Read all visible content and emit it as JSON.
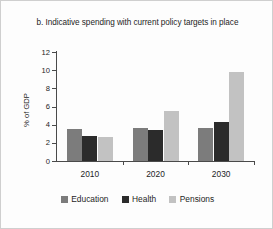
{
  "chart_data": {
    "type": "bar",
    "title": "b. Indicative spending with current policy targets in place",
    "xlabel": "",
    "ylabel": "% of GDP",
    "categories": [
      "2010",
      "2020",
      "2030"
    ],
    "series": [
      {
        "name": "Education",
        "color": "#7c7c7c",
        "values": [
          3.5,
          3.6,
          3.65
        ]
      },
      {
        "name": "Health",
        "color": "#2b2b2b",
        "values": [
          2.7,
          3.4,
          4.25
        ]
      },
      {
        "name": "Pensions",
        "color": "#c2c2c2",
        "values": [
          2.65,
          5.55,
          9.8
        ]
      }
    ],
    "ylim": [
      0,
      12
    ],
    "yticks": [
      0,
      2,
      4,
      6,
      8,
      10,
      12
    ],
    "ytick_labels": [
      "0",
      "2",
      "4",
      "6",
      "8",
      "10",
      "12"
    ],
    "grid": false,
    "legend_position": "bottom"
  }
}
